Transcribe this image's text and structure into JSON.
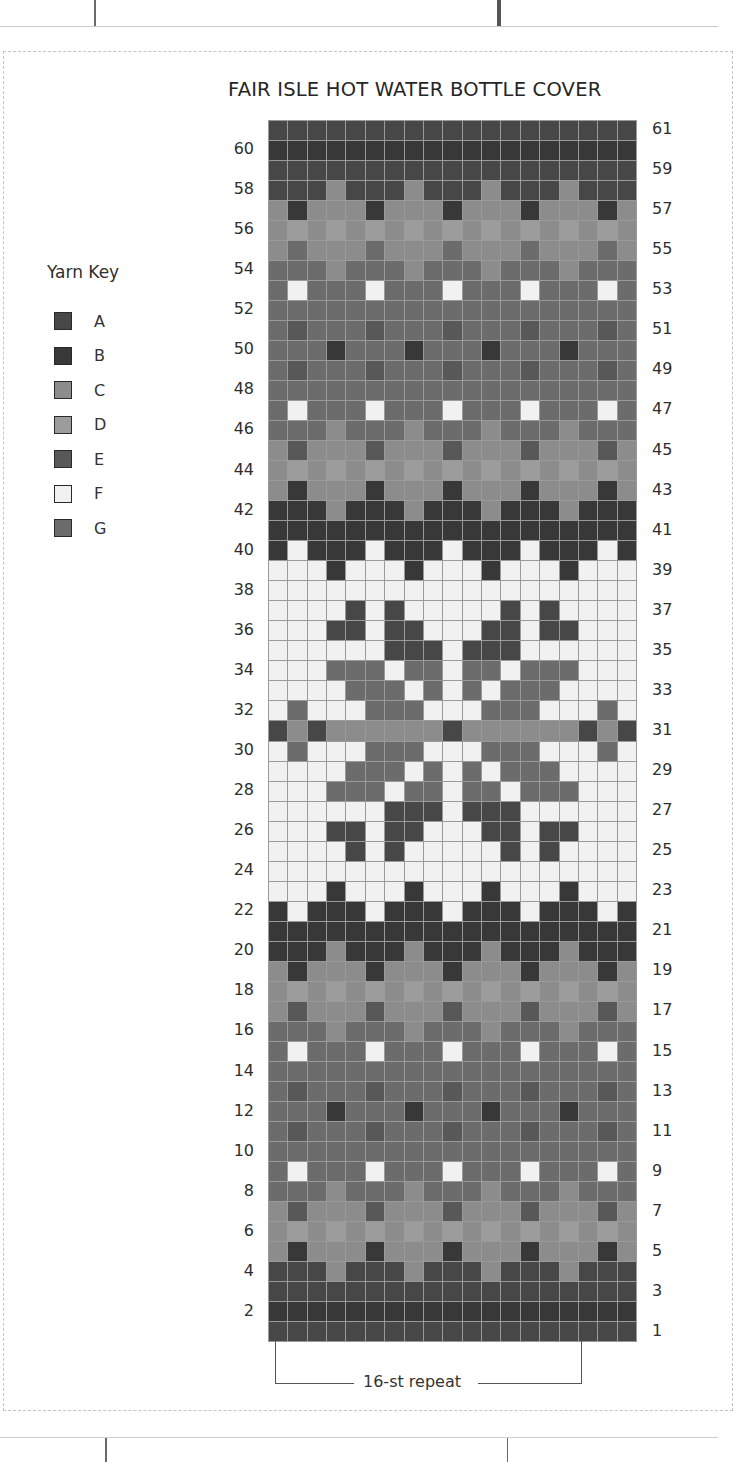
{
  "chart_title": "FAIR ISLE HOT WATER BOTTLE COVER",
  "yarn_key": {
    "title": "Yarn Key",
    "items": [
      {
        "label": "A",
        "color": "#474747"
      },
      {
        "label": "B",
        "color": "#383838"
      },
      {
        "label": "C",
        "color": "#8c8c8c"
      },
      {
        "label": "D",
        "color": "#9c9c9c"
      },
      {
        "label": "E",
        "color": "#585858"
      },
      {
        "label": "F",
        "color": "#f1f1f1"
      },
      {
        "label": "G",
        "color": "#6c6c6c"
      }
    ]
  },
  "repeat_label": "16-st repeat",
  "left_row_numbers": [
    "60",
    "58",
    "56",
    "54",
    "52",
    "50",
    "48",
    "46",
    "44",
    "42",
    "40",
    "38",
    "36",
    "34",
    "32",
    "30",
    "28",
    "26",
    "24",
    "22",
    "20",
    "18",
    "16",
    "14",
    "12",
    "10",
    "8",
    "6",
    "4",
    "2"
  ],
  "right_row_numbers": [
    "61",
    "59",
    "57",
    "55",
    "53",
    "51",
    "49",
    "47",
    "45",
    "43",
    "41",
    "39",
    "37",
    "35",
    "33",
    "31",
    "29",
    "27",
    "25",
    "23",
    "21",
    "19",
    "17",
    "15",
    "13",
    "11",
    "9",
    "7",
    "5",
    "3",
    "1"
  ],
  "chart_data": {
    "type": "table",
    "title": "FAIR ISLE HOT WATER BOTTLE COVER",
    "columns": 19,
    "rows_count": 61,
    "repeat_stitches": 16,
    "legend": [
      "A",
      "B",
      "C",
      "D",
      "E",
      "F",
      "G"
    ],
    "rows_top_to_bottom": [
      {
        "row": 61,
        "cells": "AAAAAAAAAAAAAAAAAAA"
      },
      {
        "row": 60,
        "cells": "BBBBBBBBBBBBBBBBBBB"
      },
      {
        "row": 59,
        "cells": "AAAAAAAAAAAAAAAAAAA"
      },
      {
        "row": 58,
        "cells": "AAACAAACAAACAAACAAA"
      },
      {
        "row": 57,
        "cells": "CBCCCBCCCBCCCBCCCBC"
      },
      {
        "row": 56,
        "cells": "CDCDCDCDCDCDCDCDCDC"
      },
      {
        "row": 55,
        "cells": "CGCCCGCCCGCCCGCCCGC"
      },
      {
        "row": 54,
        "cells": "GGGCGGGCGGGCGGGCGGG"
      },
      {
        "row": 53,
        "cells": "GFGGGFGGGFGGGFGGGFG"
      },
      {
        "row": 52,
        "cells": "GGGGGGGGGGGGGGGGGGG"
      },
      {
        "row": 51,
        "cells": "GEGGGEGGGEGGGEGGGEG"
      },
      {
        "row": 50,
        "cells": "GGGBGGGBGGGBGGGBGGG"
      },
      {
        "row": 49,
        "cells": "GEGGGEGGGEGGGEGGGEG"
      },
      {
        "row": 48,
        "cells": "GGGGGGGGGGGGGGGGGGG"
      },
      {
        "row": 47,
        "cells": "GFGGGFGGGFGGGFGGGFG"
      },
      {
        "row": 46,
        "cells": "GGGCGGGCGGGCGGGCGGG"
      },
      {
        "row": 45,
        "cells": "CECCCECCCECCCECCCEC"
      },
      {
        "row": 44,
        "cells": "CDCDCDCDCDCDCDCDCDC"
      },
      {
        "row": 43,
        "cells": "CBCCCBCCCBCCCBCCCBC"
      },
      {
        "row": 42,
        "cells": "BBBCBBBCBBBCBBBCBBB"
      },
      {
        "row": 41,
        "cells": "BBBBBBBBBBBBBBBBBBB"
      },
      {
        "row": 40,
        "cells": "BFBBBFBBBFBBBFBBBFB"
      },
      {
        "row": 39,
        "cells": "FFFBFFFBFFFBFFFBFFF"
      },
      {
        "row": 38,
        "cells": "FFFFFFFFFFFFFFFFFFF"
      },
      {
        "row": 37,
        "cells": "FFFFAFAFFFFFAFAFFFF"
      },
      {
        "row": 36,
        "cells": "FFFAAFAAFFFAAFAAFFF"
      },
      {
        "row": 35,
        "cells": "FFFFFFAAAFAAAFFFFFF"
      },
      {
        "row": 34,
        "cells": "FFFGGGFGGFGGFGGGFFF"
      },
      {
        "row": 33,
        "cells": "FFFFGGGFGFGFGGGFFFF"
      },
      {
        "row": 32,
        "cells": "FGFFFGGGFFFGGGFFFGF"
      },
      {
        "row": 31,
        "cells": "ACACCCCCCACCCCCCACA"
      },
      {
        "row": 30,
        "cells": "FGFFFGGGFFFGGGFFFGF"
      },
      {
        "row": 29,
        "cells": "FFFFGGGFGFGFGGGFFFF"
      },
      {
        "row": 28,
        "cells": "FFFGGGFGGFGGFGGGFFF"
      },
      {
        "row": 27,
        "cells": "FFFFFFAAAFAAAFFFFFF"
      },
      {
        "row": 26,
        "cells": "FFFAAFAAFFFAAFAAFFF"
      },
      {
        "row": 25,
        "cells": "FFFFAFAFFFFFAFAFFFF"
      },
      {
        "row": 24,
        "cells": "FFFFFFFFFFFFFFFFFFF"
      },
      {
        "row": 23,
        "cells": "FFFBFFFBFFFBFFFBFFF"
      },
      {
        "row": 22,
        "cells": "BFBBBFBBBFBBBFBBBFB"
      },
      {
        "row": 21,
        "cells": "BBBBBBBBBBBBBBBBBBB"
      },
      {
        "row": 20,
        "cells": "BBBCBBBCBBBCBBBCBBB"
      },
      {
        "row": 19,
        "cells": "CBCCCBCCCBCCCBCCCBC"
      },
      {
        "row": 18,
        "cells": "CDCDCDCDCDCDCDCDCDC"
      },
      {
        "row": 17,
        "cells": "CECCCECCCECCCECCCEC"
      },
      {
        "row": 16,
        "cells": "GGGCGGGCGGGCGGGCGGG"
      },
      {
        "row": 15,
        "cells": "GFGGGFGGGFGGGFGGGFG"
      },
      {
        "row": 14,
        "cells": "GGGGGGGGGGGGGGGGGGG"
      },
      {
        "row": 13,
        "cells": "GEGGGEGGGEGGGEGGGEG"
      },
      {
        "row": 12,
        "cells": "GGGBGGGBGGGBGGGBGGG"
      },
      {
        "row": 11,
        "cells": "GEGGGEGGGEGGGEGGGEG"
      },
      {
        "row": 10,
        "cells": "GGGGGGGGGGGGGGGGGGG"
      },
      {
        "row": 9,
        "cells": "GFGGGFGGGFGGGFGGGFG"
      },
      {
        "row": 8,
        "cells": "GGGCGGGCGGGCGGGCGGG"
      },
      {
        "row": 7,
        "cells": "CECCCECCCECCCECCCEC"
      },
      {
        "row": 6,
        "cells": "CDCDCDCDCDCDCDCDCDC"
      },
      {
        "row": 5,
        "cells": "CBCCCBCCCBCCCBCCCBC"
      },
      {
        "row": 4,
        "cells": "AAACAAACAAACAAACAAA"
      },
      {
        "row": 3,
        "cells": "AAAAAAAAAAAAAAAAAAA"
      },
      {
        "row": 2,
        "cells": "BBBBBBBBBBBBBBBBBBB"
      },
      {
        "row": 1,
        "cells": "AAAAAAAAAAAAAAAAAAA"
      }
    ]
  }
}
